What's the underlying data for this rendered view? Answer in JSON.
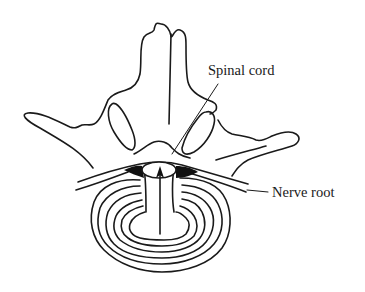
{
  "diagram": {
    "labels": {
      "spinal_cord": "Spinal cord",
      "nerve_root": "Nerve root"
    },
    "elements": [
      "vertebral spinous process",
      "transverse processes",
      "articular facets",
      "lamina arch",
      "spinal cord",
      "nerve roots",
      "intervertebral disc with annular rings",
      "herniation arrow"
    ],
    "colors": {
      "line": "#1a1a1a",
      "background": "#ffffff"
    }
  }
}
